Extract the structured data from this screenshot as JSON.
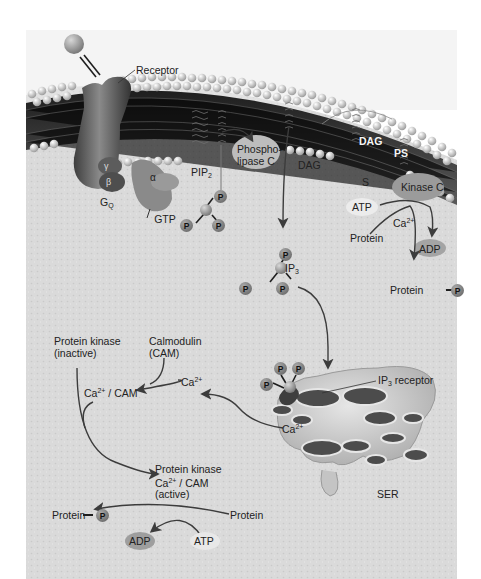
{
  "diagram": {
    "title": "",
    "type": "signal-transduction-pathway",
    "colors": {
      "cytoplasm": "#d9d9d9",
      "membrane_head": "#c8c8c8",
      "membrane_core": "#3a3a3a",
      "protein_dark": "#5a5a5a",
      "arrow": "#3c3c3c",
      "background": "#ffffff"
    },
    "labels": {
      "receptor": "Receptor",
      "gamma": "γ",
      "beta": "β",
      "alpha": "α",
      "g_q_main": "G",
      "g_q_sub": "Q",
      "gtp": "GTP",
      "pip2_main": "PIP",
      "pip2_sub": "2",
      "plc_line1": "Phospho-",
      "plc_line2": "lipase C",
      "dag_cyto": "DAG",
      "dag_membrane": "DAG",
      "ps": "PS",
      "s": "S",
      "kinase_c": "Kinase C",
      "atp_pkc": "ATP",
      "ca_pkc_main": "Ca",
      "ca_pkc_sup": "2+",
      "protein_pkc": "Protein",
      "adp_pkc": "ADP",
      "protein_p_pkc": "Protein",
      "ip3_main": "IP",
      "ip3_sub": "3",
      "ip3_receptor_main": "IP",
      "ip3_receptor_sub": "3",
      "ip3_receptor_rest": " receptor",
      "ca_er_main": "Ca",
      "ca_er_sup": "2+",
      "ser": "SER",
      "ca_free_main": "Ca",
      "ca_free_sup": "2+",
      "pk_inactive_line1": "Protein kinase",
      "pk_inactive_line2": "(inactive)",
      "calmodulin_line1": "Calmodulin",
      "calmodulin_line2": "(CAM)",
      "ca_cam_main": "Ca",
      "ca_cam_sup": "2+",
      "ca_cam_rest": " / CAM",
      "pk_active_line1": "Protein kinase",
      "pk_active_ca": "Ca",
      "pk_active_sup": "2+",
      "pk_active_rest": " / CAM",
      "pk_active_line3": "(active)",
      "protein_p_bottom": "Protein",
      "protein_bottom": "Protein",
      "adp_bottom": "ADP",
      "atp_bottom": "ATP",
      "phosphate": "P"
    }
  }
}
